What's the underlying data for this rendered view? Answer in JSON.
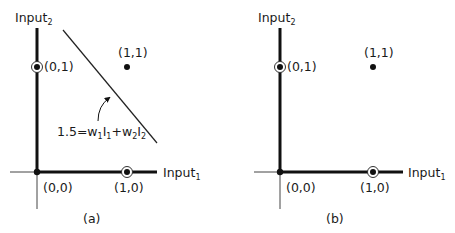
{
  "colors": {
    "ink": "#111111",
    "thin_axis": "#444444",
    "background": "#ffffff"
  },
  "panels": [
    {
      "id": "a",
      "caption": "(a)",
      "y_axis_label": "Input",
      "y_axis_sub": "2",
      "x_axis_label": "Input",
      "x_axis_sub": "1",
      "points": {
        "p00": "(0,0)",
        "p10": "(1,0)",
        "p01": "(0,1)",
        "p11": "(1,1)"
      },
      "circled_points": [
        "(0,1)",
        "(1,0)"
      ],
      "filled_points": [
        "(0,0)",
        "(1,1)"
      ],
      "decision_boundary": {
        "present": true,
        "eq_prefix": "1.5=w",
        "w1_sub": "1",
        "i1": "I",
        "i1_sub": "1",
        "plus": "+w",
        "w2_sub": "2",
        "i2": "I",
        "i2_sub": "2"
      }
    },
    {
      "id": "b",
      "caption": "(b)",
      "y_axis_label": "Input",
      "y_axis_sub": "2",
      "x_axis_label": "Input",
      "x_axis_sub": "1",
      "points": {
        "p00": "(0,0)",
        "p10": "(1,0)",
        "p01": "(0,1)",
        "p11": "(1,1)"
      },
      "circled_points": [
        "(0,1)",
        "(1,0)"
      ],
      "filled_points": [
        "(0,0)",
        "(1,1)"
      ],
      "decision_boundary": {
        "present": false
      }
    }
  ]
}
